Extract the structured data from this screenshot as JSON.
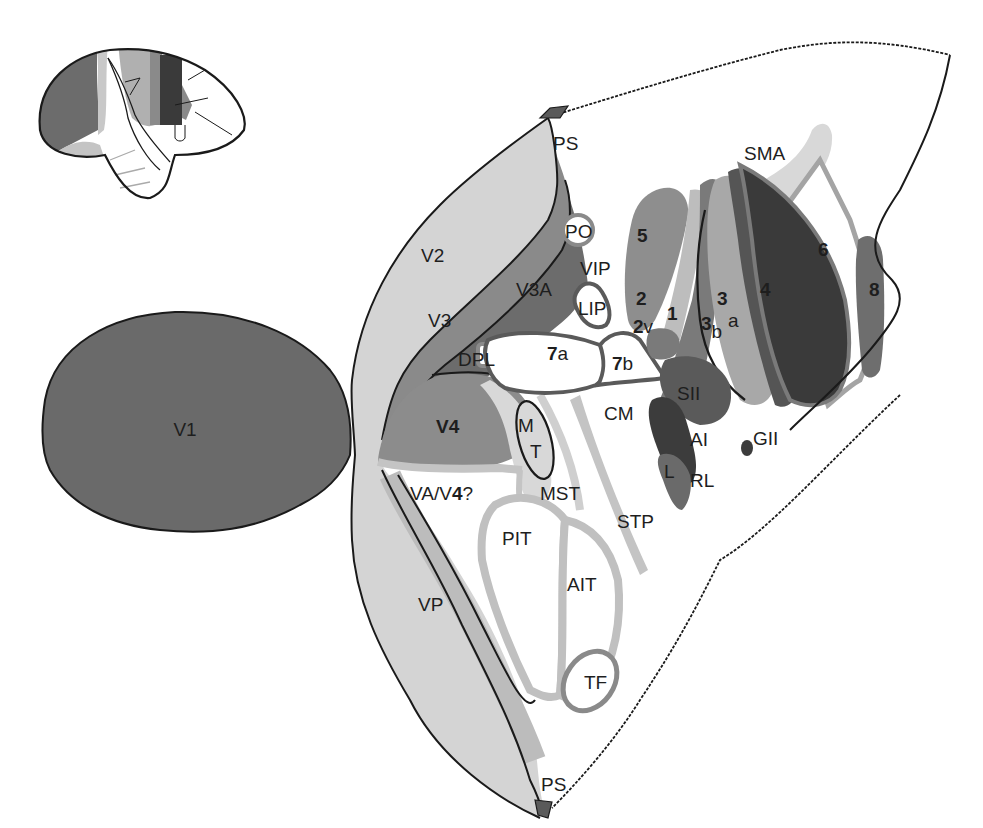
{
  "diagram": {
    "type": "flattened-cortex-map",
    "colors": {
      "background": "#ffffff",
      "outline": "#1a1a1a",
      "v1": "#6a6a6a",
      "v2": "#d4d4d4",
      "v3": "#8a8a8a",
      "v3a": "#6c6c6c",
      "v4": "#8c8c8c",
      "pale_band": "#c4c4c4",
      "area5": "#8e8e8e",
      "area4": "#3a3a3a",
      "area3a": "#555555",
      "area3b": "#a8a8a8",
      "area1": "#7a7a7a",
      "area2": "#bdbdbd",
      "sma": "#d8d8d8",
      "area6_outline": "#a4a4a4",
      "area8": "#6e6e6e",
      "sii": "#5a5a5a",
      "ai": "#3c3c3c",
      "rl": "#6a6a6a",
      "ps_marker": "#5a5a5a"
    },
    "labels": {
      "v1": "V1",
      "v2": "V2",
      "v3": "V3",
      "v3a": "V3A",
      "v4": "V4",
      "dpl": "DPL",
      "po": "PO",
      "vip": "VIP",
      "lip": "LIP",
      "area7a_num": "7",
      "area7a_sub": "a",
      "area7b_num": "7",
      "area7b_sub": "b",
      "mt_m": "M",
      "mt_t": "T",
      "mst": "MST",
      "stp": "STP",
      "va_v4_pre": "VA/V",
      "va_v4_num": "4",
      "va_v4_post": "?",
      "pit": "PIT",
      "ait": "AIT",
      "tf": "TF",
      "vp": "VP",
      "ps_top": "PS",
      "ps_bottom": "PS",
      "cm": "CM",
      "sii": "SII",
      "ai": "AI",
      "l": "L",
      "rl": "RL",
      "gii": "GII",
      "area5": "5",
      "area2": "2",
      "area2v_num": "2",
      "area2v_sub": "v",
      "area1": "1",
      "area3": "3",
      "area3a_sub": "a",
      "area3b_num": "3",
      "area3b_sub": "b",
      "area4": "4",
      "area6": "6",
      "area8": "8",
      "sma": "SMA"
    }
  }
}
